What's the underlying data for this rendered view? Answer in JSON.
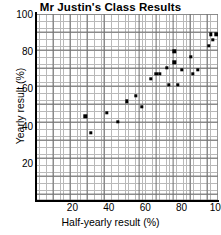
{
  "chart_data": {
    "type": "scatter",
    "title": "Mr Justin's Class Results",
    "xlabel": "Half-yearly result (%)",
    "ylabel": "Yearly result (%)",
    "xlim": [
      0,
      100
    ],
    "ylim": [
      0,
      100
    ],
    "xticks": [
      20,
      40,
      60,
      80,
      100
    ],
    "yticks": [
      20,
      40,
      60,
      80,
      100
    ],
    "grid": true,
    "grid_minor_step": 2,
    "grid_major_step": 10,
    "legend": null,
    "marker": "filled-square",
    "marker_color": "#000000",
    "points": [
      {
        "x": 27,
        "y": 45
      },
      {
        "x": 30,
        "y": 36
      },
      {
        "x": 39,
        "y": 47
      },
      {
        "x": 45,
        "y": 42
      },
      {
        "x": 50,
        "y": 53
      },
      {
        "x": 55,
        "y": 56
      },
      {
        "x": 58,
        "y": 50
      },
      {
        "x": 63,
        "y": 65
      },
      {
        "x": 66,
        "y": 68
      },
      {
        "x": 68,
        "y": 68
      },
      {
        "x": 72,
        "y": 71
      },
      {
        "x": 73,
        "y": 62
      },
      {
        "x": 76,
        "y": 80
      },
      {
        "x": 76,
        "y": 74
      },
      {
        "x": 78,
        "y": 62
      },
      {
        "x": 80,
        "y": 70
      },
      {
        "x": 85,
        "y": 77
      },
      {
        "x": 86,
        "y": 68
      },
      {
        "x": 89,
        "y": 70
      },
      {
        "x": 95,
        "y": 83
      },
      {
        "x": 96,
        "y": 89
      },
      {
        "x": 97,
        "y": 86
      },
      {
        "x": 99,
        "y": 89
      }
    ]
  }
}
